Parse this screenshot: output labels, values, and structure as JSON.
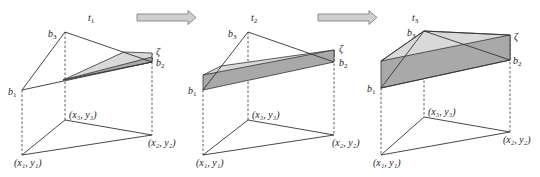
{
  "figure": {
    "colors": {
      "line": "#333333",
      "plane_light": "#d9d9d9",
      "plane_dark": "#a9a9a9",
      "arrow_fill": "#cfcfcf"
    },
    "panels": [
      {
        "time_label": "t",
        "time_sub": "1",
        "labels": {
          "b1": "b",
          "b1_sub": "1",
          "b2": "b",
          "b2_sub": "2",
          "b3": "b",
          "b3_sub": "3",
          "zeta": "ζ"
        },
        "base": {
          "p1": "(x₁, y₁)",
          "p2": "(x₂, y₂)",
          "p3": "(x₃, y₃)"
        }
      },
      {
        "time_label": "t",
        "time_sub": "2",
        "labels": {
          "b1": "b",
          "b1_sub": "1",
          "b2": "b",
          "b2_sub": "2",
          "b3": "b",
          "b3_sub": "3",
          "zeta": "ζ"
        },
        "base": {
          "p1": "(x₁, y₁)",
          "p2": "(x₂, y₂)",
          "p3": "(x₃, y₃)"
        }
      },
      {
        "time_label": "t",
        "time_sub": "3",
        "labels": {
          "b1": "b",
          "b1_sub": "1",
          "b2": "b",
          "b2_sub": "2",
          "b3": "b",
          "b3_sub": "3",
          "zeta": "ζ"
        },
        "base": {
          "p1": "(x₁, y₁)",
          "p2": "(x₂, y₂)",
          "p3": "(x₃, y₃)"
        }
      }
    ],
    "arrows": [
      {
        "from": "t1",
        "to": "t2",
        "icon": "right-arrow-icon"
      },
      {
        "from": "t2",
        "to": "t3",
        "icon": "right-arrow-icon"
      }
    ]
  }
}
